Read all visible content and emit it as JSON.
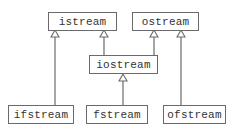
{
  "diagram": {
    "title": "",
    "type": "class-inheritance",
    "nodes": [
      {
        "id": "istream",
        "label": "istream"
      },
      {
        "id": "ostream",
        "label": "ostream"
      },
      {
        "id": "iostream",
        "label": "iostream"
      },
      {
        "id": "ifstream",
        "label": "ifstream"
      },
      {
        "id": "fstream",
        "label": "fstream"
      },
      {
        "id": "ofstream",
        "label": "ofstream"
      }
    ],
    "edges": [
      {
        "from": "ifstream",
        "to": "istream",
        "arrow": "hollow-triangle"
      },
      {
        "from": "iostream",
        "to": "istream",
        "arrow": "hollow-triangle"
      },
      {
        "from": "iostream",
        "to": "ostream",
        "arrow": "hollow-triangle"
      },
      {
        "from": "ofstream",
        "to": "ostream",
        "arrow": "hollow-triangle"
      },
      {
        "from": "fstream",
        "to": "iostream",
        "arrow": "hollow-triangle"
      }
    ],
    "colors": {
      "line": "#6a6a6a",
      "text": "#333333",
      "background": "#ffffff"
    }
  }
}
